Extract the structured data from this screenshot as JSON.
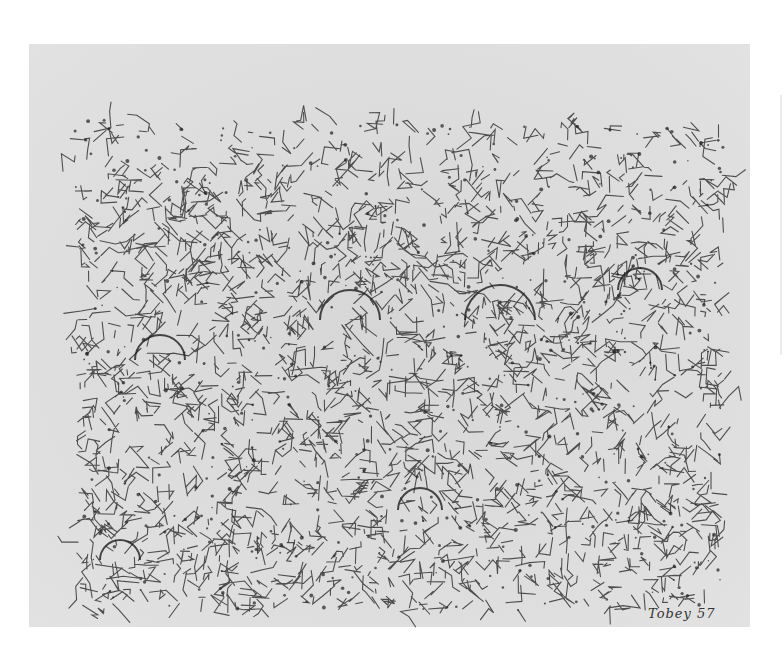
{
  "artwork": {
    "type": "abstract ink drawing on paper",
    "style": "dense calligraphic line network",
    "signature": "Tobey 57",
    "colors": {
      "background": "#ffffff",
      "paper": "#dcdcdc",
      "ink": "#1e1e1e"
    },
    "paper_bounds": {
      "x": 29,
      "y": 44,
      "width": 721,
      "height": 583
    },
    "drawing_bounds": {
      "x": 75,
      "y": 120,
      "width": 650,
      "height": 490
    }
  }
}
